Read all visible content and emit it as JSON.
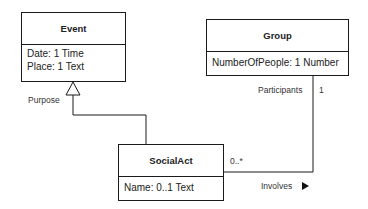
{
  "classes": {
    "event": {
      "name": "Event",
      "attributes": [
        "Date: 1 Time",
        "Place: 1 Text"
      ]
    },
    "group": {
      "name": "Group",
      "attributes": [
        "NumberOfPeople: 1 Number"
      ]
    },
    "social_act": {
      "name": "SocialAct",
      "attributes": [
        "Name: 0..1 Text"
      ]
    }
  },
  "relations": {
    "generalization": {
      "label": "Purpose",
      "from": "SocialAct",
      "to": "Event"
    },
    "association": {
      "name": "Involves",
      "direction_icon": "triangle-right",
      "group_end": {
        "role": "Participants",
        "multiplicity": "1"
      },
      "social_act_end": {
        "multiplicity": "0..*"
      }
    }
  }
}
